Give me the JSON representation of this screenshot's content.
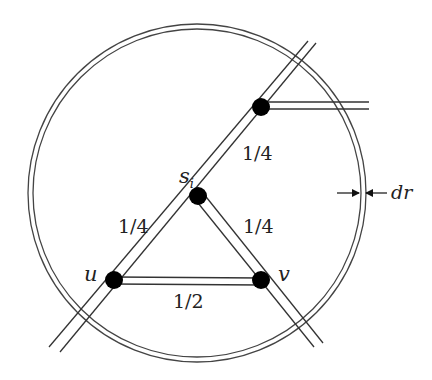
{
  "diagram": {
    "type": "graph-in-annulus",
    "colors": {
      "stroke": "#333333",
      "node": "#000000",
      "background": "#ffffff"
    },
    "annulus": {
      "center": [
        197,
        193
      ],
      "outer_radius": 169,
      "inner_radius": 164,
      "thickness_label": "dr"
    },
    "nodes": [
      {
        "id": "top",
        "label": "",
        "x": 261,
        "y": 107
      },
      {
        "id": "s_i",
        "label": "s",
        "subscript": "i",
        "x": 198,
        "y": 196
      },
      {
        "id": "u",
        "label": "u",
        "x": 114,
        "y": 280
      },
      {
        "id": "v",
        "label": "v",
        "x": 261,
        "y": 280
      }
    ],
    "edges": [
      {
        "from": "s_i",
        "to": "top",
        "weight": "1/4"
      },
      {
        "from": "s_i",
        "to": "u",
        "weight": "1/4"
      },
      {
        "from": "s_i",
        "to": "v",
        "weight": "1/4"
      },
      {
        "from": "u",
        "to": "v",
        "weight": "1/2"
      }
    ],
    "labels": {
      "si_base": "s",
      "si_sub": "i",
      "u": "u",
      "v": "v",
      "w_top": "1/4",
      "w_left": "1/4",
      "w_right": "1/4",
      "w_bottom": "1/2",
      "dr": "dr"
    }
  }
}
